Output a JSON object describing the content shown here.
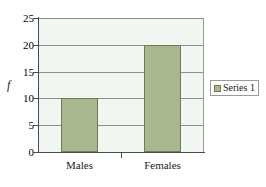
{
  "chart_data": {
    "type": "bar",
    "title": "",
    "subtitle": "",
    "xlabel": "",
    "ylabel": "f",
    "categories": [
      "Males",
      "Females"
    ],
    "values": [
      10,
      20
    ],
    "series": [
      {
        "name": "Series 1",
        "values": [
          10,
          20
        ]
      }
    ],
    "ylim": [
      0,
      25
    ],
    "ytick_labels": [
      "0",
      "5",
      "10",
      "15",
      "20",
      "25"
    ],
    "ytick_values": [
      0,
      5,
      10,
      15,
      20,
      25
    ],
    "grid": true,
    "legend_position": "right",
    "legend_entries": [
      "Series 1"
    ],
    "colors": {
      "bar_fill": "#a8b78d",
      "bar_border": "#6e7a5b",
      "plot_background": "#f2f6f0",
      "gridline": "#8e8e8e",
      "axis": "#4a4a4a",
      "text": "#1a1a1a",
      "figure_background": "#ffffff",
      "legend_border": "#9a9a9a"
    }
  },
  "legend": {
    "series_1_label": "Series 1"
  },
  "axis": {
    "y_title": "f"
  }
}
